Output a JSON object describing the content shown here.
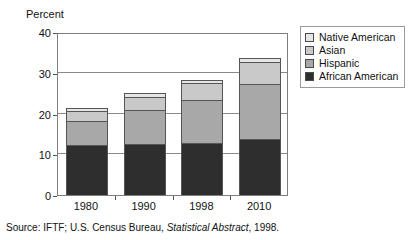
{
  "axis_title": "Percent",
  "source_note": {
    "prefix": "Source: IFTF; U.S. Census Bureau, ",
    "italic": "Statistical Abstract",
    "suffix": ", 1998."
  },
  "legend": {
    "items": [
      {
        "label": "Native American",
        "color": "#e6e6e6"
      },
      {
        "label": "Asian",
        "color": "#c9c9c9"
      },
      {
        "label": "Hispanic",
        "color": "#a8a8a8"
      },
      {
        "label": "African American",
        "color": "#2e2e2e"
      }
    ]
  },
  "chart_data": {
    "type": "bar",
    "subtype": "stacked-vertical",
    "title": "",
    "xlabel": "",
    "ylabel": "Percent",
    "ylim": [
      0,
      40
    ],
    "yticks": [
      0,
      10,
      20,
      30,
      40
    ],
    "ytick_labels": [
      "0",
      "10",
      "20",
      "30",
      "40"
    ],
    "grid": true,
    "grid_axis": "y",
    "legend_position": "right",
    "categories": [
      "1980",
      "1990",
      "1998",
      "2010"
    ],
    "series": [
      {
        "name": "African American",
        "color": "#2e2e2e",
        "values": [
          12.0,
          12.2,
          12.6,
          13.5
        ]
      },
      {
        "name": "Hispanic",
        "color": "#a8a8a8",
        "values": [
          6.0,
          8.3,
          10.4,
          13.5
        ]
      },
      {
        "name": "Asian",
        "color": "#c9c9c9",
        "values": [
          2.3,
          3.3,
          4.3,
          5.5
        ]
      },
      {
        "name": "Native American",
        "color": "#e6e6e6",
        "values": [
          0.7,
          0.9,
          0.8,
          1.0
        ]
      }
    ],
    "totals": [
      21.0,
      24.7,
      28.1,
      33.5
    ]
  }
}
